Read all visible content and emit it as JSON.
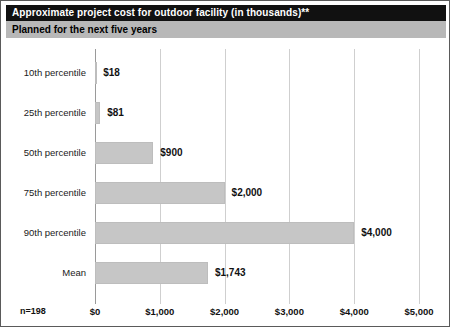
{
  "header": {
    "title": "Approximate project cost for outdoor facility (in thousands)**",
    "subtitle": "Planned for the next five years"
  },
  "footer": {
    "sample_size": "n=198"
  },
  "colors": {
    "title_bar_bg": "#111111",
    "title_bar_text": "#ffffff",
    "subtitle_bar_bg": "#b8b8b8",
    "bar_fill": "#c6c6c6",
    "gridline": "#cfcfcf",
    "axis_zero": "#9a9a9a",
    "border": "#5a5a5a"
  },
  "chart_data": {
    "type": "bar",
    "orientation": "horizontal",
    "title": "Approximate project cost for outdoor facility (in thousands)**",
    "subtitle": "Planned for the next five years",
    "categories": [
      "10th percentile",
      "25th percentile",
      "50th percentile",
      "75th percentile",
      "90th percentile",
      "Mean"
    ],
    "values": [
      18,
      81,
      900,
      2000,
      4000,
      1743
    ],
    "value_labels": [
      "$18",
      "$81",
      "$900",
      "$2,000",
      "$4,000",
      "$1,743"
    ],
    "xlabel": "",
    "ylabel": "",
    "xlim": [
      0,
      5000
    ],
    "xticks": [
      0,
      1000,
      2000,
      3000,
      4000,
      5000
    ],
    "xticklabels": [
      "$0",
      "$1,000",
      "$2,000",
      "$3,000",
      "$4,000",
      "$5,000"
    ],
    "grid": "vertical",
    "legend": "none",
    "annotation": "n=198"
  }
}
